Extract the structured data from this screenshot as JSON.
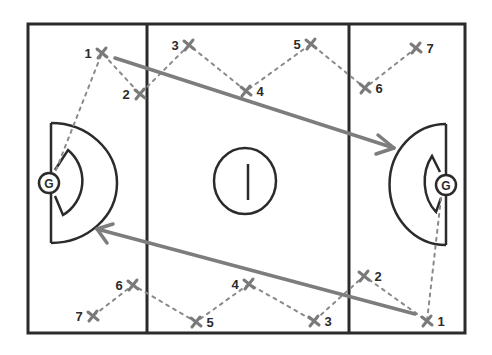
{
  "diagram": {
    "type": "netball court play diagram",
    "court": {
      "left": 28,
      "top": 24,
      "right": 465,
      "bottom": 333,
      "divider_lines_x": [
        147,
        349
      ]
    },
    "center_circle": {
      "cx": 245,
      "cy": 180,
      "rx": 31,
      "ry": 33,
      "center_mark": "vertical line"
    },
    "goals": [
      {
        "side": "left",
        "label": "G",
        "cx": 49,
        "cy": 183
      },
      {
        "side": "right",
        "label": "G",
        "cx": 446,
        "cy": 185
      }
    ],
    "colors": {
      "court_lines": "#2b2b2b",
      "markers": "#7a7a7a",
      "pass_lines": "#8a8a8a",
      "arrows": "#7d7d7d"
    },
    "top_team": {
      "players": [
        {
          "label": "1",
          "x": 102,
          "y": 53,
          "label_side": "left"
        },
        {
          "label": "2",
          "x": 140,
          "y": 94,
          "label_side": "left"
        },
        {
          "label": "3",
          "x": 189,
          "y": 45,
          "label_side": "left"
        },
        {
          "label": "4",
          "x": 246,
          "y": 91,
          "label_side": "right"
        },
        {
          "label": "5",
          "x": 311,
          "y": 44,
          "label_side": "left"
        },
        {
          "label": "6",
          "x": 365,
          "y": 88,
          "label_side": "right"
        },
        {
          "label": "7",
          "x": 416,
          "y": 48,
          "label_side": "right"
        }
      ],
      "pass_path_start": "left-goal",
      "arrow": {
        "from": [
          115,
          58
        ],
        "to": [
          394,
          148
        ],
        "direction": "toward right goal"
      }
    },
    "bottom_team": {
      "players": [
        {
          "label": "1",
          "x": 427,
          "y": 321,
          "label_side": "right"
        },
        {
          "label": "2",
          "x": 364,
          "y": 276,
          "label_side": "right"
        },
        {
          "label": "3",
          "x": 314,
          "y": 321,
          "label_side": "right"
        },
        {
          "label": "4",
          "x": 249,
          "y": 284,
          "label_side": "left"
        },
        {
          "label": "5",
          "x": 196,
          "y": 322,
          "label_side": "right"
        },
        {
          "label": "6",
          "x": 133,
          "y": 285,
          "label_side": "left"
        },
        {
          "label": "7",
          "x": 93,
          "y": 316,
          "label_side": "left"
        }
      ],
      "pass_path_start": "right-goal",
      "arrow": {
        "from": [
          415,
          314
        ],
        "to": [
          97,
          229
        ],
        "direction": "toward left goal"
      }
    }
  }
}
